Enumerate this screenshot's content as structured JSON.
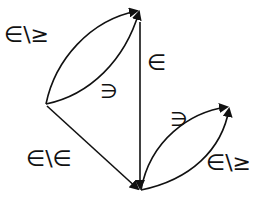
{
  "diagram": {
    "nodes": [
      {
        "id": "left",
        "x": 46,
        "y": 104
      },
      {
        "id": "top",
        "x": 139,
        "y": 10
      },
      {
        "id": "bottom",
        "x": 140,
        "y": 190
      },
      {
        "id": "right",
        "x": 229,
        "y": 107
      }
    ],
    "edges": [
      {
        "from": "left",
        "to": "top",
        "curve": "upper",
        "label": "∈\\≥"
      },
      {
        "from": "left",
        "to": "top",
        "curve": "lower",
        "label": "∋"
      },
      {
        "from": "top",
        "to": "bottom",
        "curve": "straight",
        "label": "∈"
      },
      {
        "from": "left",
        "to": "bottom",
        "curve": "straight",
        "label": "∈\\∈"
      },
      {
        "from": "bottom",
        "to": "right",
        "curve": "upper",
        "label": "∋"
      },
      {
        "from": "bottom",
        "to": "right",
        "curve": "lower",
        "label": "∈\\≥"
      }
    ],
    "labels": {
      "top_outer": "∈\\≥",
      "top_inner": "∋",
      "vertical": "∈",
      "diagonal": "∈\\∈",
      "right_upper": "∋",
      "right_lower": "∈\\≥"
    },
    "colors": {
      "stroke": "#111111",
      "background": "#ffffff"
    }
  }
}
